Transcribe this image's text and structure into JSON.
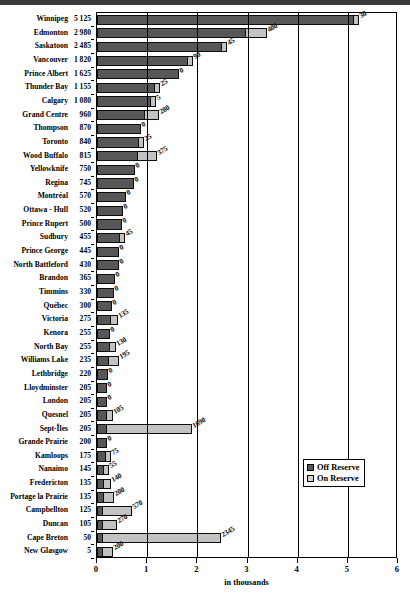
{
  "chart_data": {
    "type": "bar",
    "orientation": "horizontal",
    "stacked": true,
    "title": "",
    "xlabel": "in thousands",
    "ylabel": "",
    "xlim": [
      0,
      6
    ],
    "xticks": [
      "0",
      "1",
      "2",
      "3",
      "4",
      "5",
      "6"
    ],
    "grid": true,
    "legend_position": "right-lower",
    "categories": [
      "Winnipeg",
      "Edmonton",
      "Saskatoon",
      "Vancouver",
      "Prince Albert",
      "Thunder Bay",
      "Calgary",
      "Grand Centre",
      "Thompson",
      "Toronto",
      "Wood Buffalo",
      "Yellowknife",
      "Regina",
      "Montréal",
      "Ottawa - Hull",
      "Prince Rupert",
      "Sudbury",
      "Prince George",
      "North Battleford",
      "Brandon",
      "Timmins",
      "Québec",
      "Victoria",
      "Kenora",
      "North Bay",
      "Williams Lake",
      "Lethbridge",
      "Lloydminster",
      "London",
      "Quesnel",
      "Sept-Îles",
      "Grande Prairie",
      "Kamloops",
      "Nanaimo",
      "Fredericton",
      "Portage la Prairie",
      "Campbellton",
      "Duncan",
      "Cape Breton",
      "New Glasgow"
    ],
    "category_value_labels": [
      "5 125",
      "2 980",
      "2 485",
      "1 820",
      "1 625",
      "1 155",
      "1 080",
      "960",
      "870",
      "840",
      "815",
      "750",
      "745",
      "570",
      "520",
      "500",
      "455",
      "445",
      "430",
      "365",
      "330",
      "300",
      "275",
      "255",
      "255",
      "235",
      "220",
      "205",
      "205",
      "205",
      "205",
      "200",
      "175",
      "145",
      "135",
      "135",
      "125",
      "105",
      "50",
      "5"
    ],
    "series": [
      {
        "name": "Off Reserve",
        "color": "#575757",
        "values": [
          5125,
          2980,
          2485,
          1820,
          1625,
          1155,
          1080,
          960,
          870,
          840,
          815,
          750,
          745,
          570,
          520,
          500,
          455,
          445,
          430,
          365,
          330,
          300,
          275,
          255,
          255,
          235,
          220,
          205,
          205,
          205,
          205,
          200,
          175,
          145,
          135,
          135,
          125,
          105,
          50,
          5
        ]
      },
      {
        "name": "On Reserve",
        "color": "#c3c3c3",
        "values": [
          30,
          400,
          45,
          90,
          0,
          25,
          5,
          280,
          0,
          25,
          375,
          0,
          0,
          0,
          0,
          0,
          45,
          0,
          0,
          0,
          0,
          0,
          135,
          0,
          130,
          195,
          0,
          0,
          0,
          105,
          1690,
          0,
          75,
          55,
          140,
          200,
          570,
          270,
          2345,
          200
        ],
        "data_labels": [
          "30",
          "400",
          "45",
          "90",
          "0",
          "25",
          "5",
          "280",
          "0",
          "25",
          "375",
          "0",
          "0",
          "0",
          "0",
          "0",
          "45",
          "0",
          "0",
          "0",
          "0",
          "0",
          "135",
          "0",
          "130",
          "195",
          "0",
          "0",
          "0",
          "105",
          "1690",
          "0",
          "75",
          "55",
          "140",
          "200",
          "570",
          "270",
          "2345",
          "200"
        ]
      }
    ]
  },
  "legend": {
    "items": [
      {
        "label": "Off Reserve",
        "swatch": "off"
      },
      {
        "label": "On Reserve",
        "swatch": "on"
      }
    ]
  },
  "axis": {
    "x_title": "in thousands"
  }
}
